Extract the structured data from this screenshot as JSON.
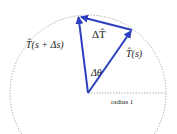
{
  "diagram": {
    "labels": {
      "delta_T": "ΔT̂",
      "T_s_plus": "T̂(s + Δs)",
      "T_s": "T̂(s)",
      "delta_theta": "Δθ",
      "radius": "radius 1"
    },
    "colors": {
      "vector": "#2b3fbf",
      "circle": "#888888",
      "text": "#222222"
    }
  }
}
